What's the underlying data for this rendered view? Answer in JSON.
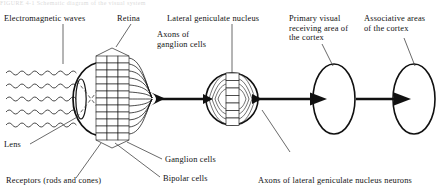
{
  "figure": {
    "cut_caption": "FIGURE 4-1   Schematic diagram of the visual system",
    "labels": {
      "electromagnetic_waves": "Electromagnetic waves",
      "retina": "Retina",
      "lateral_geniculate_nucleus": "Lateral geniculate nucleus",
      "axons_of_ganglion_cells": "Axons of\nganglion cells",
      "primary_visual_cortex": "Primary visual\nreceiving area of\nthe cortex",
      "associative_areas": "Associative areas\nof the cortex",
      "lens": "Lens",
      "receptors": "Receptors (rods and cones)",
      "bipolar_cells": "Bipolar cells",
      "ganglion_cells": "Ganglion cells",
      "axons_of_lgn_neurons": "Axons of lateral geniculate nucleus neurons"
    },
    "colors": {
      "ink": "#111111",
      "line": "#1a1a1a",
      "background": "#ffffff"
    },
    "structure": {
      "wave_count": 5,
      "retina_columns": 3,
      "retina_rows": 12,
      "cortex_ellipses": 2
    }
  }
}
